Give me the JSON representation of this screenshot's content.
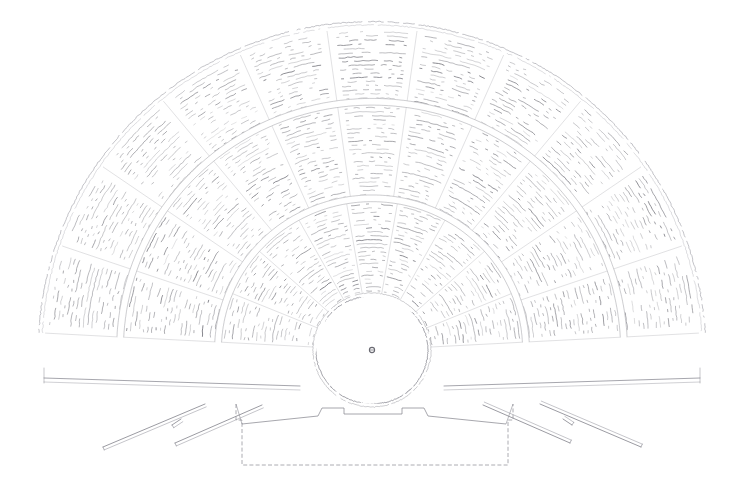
{
  "document": {
    "kind": "archaeological-plan",
    "subject": "Ancient Greek theatre ground plan",
    "medium": "faded ink line drawing on white paper",
    "background_color": "#ffffff",
    "width": 742,
    "height": 494
  },
  "palette": {
    "paper": "#ffffff",
    "seat_line": "#8d8d93",
    "seat_line_dark": "#6e6e76",
    "wall_line": "#7b7b84",
    "outer_arc": "#9a9aa2",
    "orchestra_line": "#7c7c86",
    "center_mark": "#5a5a63",
    "skene_line": "#84848d"
  },
  "geometry": {
    "center": {
      "x": 372,
      "y": 350
    },
    "orchestra": {
      "label": "orchestra",
      "radius_x": 56,
      "radius_y": 54,
      "center_x": 372,
      "center_y": 350
    },
    "center_mark": {
      "label": "omphalos-altar-mark",
      "x": 372,
      "y": 350,
      "radius": 2.6
    },
    "cavea": {
      "label": "cavea-seating-bowl",
      "inner_radius": 58,
      "outer_radius": 330,
      "start_angle_deg": 183,
      "end_angle_deg": 357,
      "squash_y": 0.985
    },
    "tiers": [
      {
        "name": "ima-cavea",
        "r_start": 60,
        "r_end": 150,
        "row_gap": 4.0,
        "wedges": 9
      },
      {
        "name": "media-cavea",
        "r_start": 158,
        "r_end": 248,
        "row_gap": 4.2,
        "wedges": 11
      },
      {
        "name": "summa-cavea",
        "r_start": 256,
        "r_end": 326,
        "row_gap": 4.2,
        "wedges": 11
      }
    ],
    "diazomata": [
      {
        "name": "lower-diazoma",
        "radius": 154
      },
      {
        "name": "upper-diazoma",
        "radius": 252
      }
    ],
    "analemma_left": {
      "x1": 44,
      "y1": 378,
      "x2": 300,
      "y2": 386
    },
    "analemma_right": {
      "x1": 700,
      "y1": 378,
      "x2": 444,
      "y2": 386
    },
    "parodos_walls": [
      {
        "name": "left-outer-parodos-wall",
        "x1": 103,
        "y1": 447,
        "x2": 205,
        "y2": 404
      },
      {
        "name": "left-inner-parodos-wall",
        "x1": 175,
        "y1": 443,
        "x2": 262,
        "y2": 405
      },
      {
        "name": "left-return-stub",
        "x1": 172,
        "y1": 425,
        "x2": 181,
        "y2": 419
      },
      {
        "name": "right-outer-parodos-wall",
        "x1": 641,
        "y1": 447,
        "x2": 540,
        "y2": 404
      },
      {
        "name": "right-inner-parodos-wall",
        "x1": 570,
        "y1": 443,
        "x2": 483,
        "y2": 405
      },
      {
        "name": "right-return-stub",
        "x1": 572,
        "y1": 425,
        "x2": 563,
        "y2": 419
      }
    ],
    "skene": {
      "name": "skene-stage-building",
      "outline": [
        [
          236,
          404
        ],
        [
          236,
          420
        ],
        [
          242,
          420
        ],
        [
          242,
          465
        ],
        [
          508,
          465
        ],
        [
          508,
          420
        ],
        [
          513,
          420
        ],
        [
          513,
          404
        ]
      ],
      "proskenion_front": [
        [
          242,
          424
        ],
        [
          318,
          416
        ],
        [
          322,
          408
        ],
        [
          344,
          408
        ],
        [
          344,
          414
        ],
        [
          402,
          414
        ],
        [
          402,
          408
        ],
        [
          424,
          408
        ],
        [
          428,
          416
        ],
        [
          506,
          424
        ]
      ]
    }
  },
  "legend": {
    "features": [
      {
        "key": "cavea",
        "label": "Cavea (auditorium)"
      },
      {
        "key": "orchestra",
        "label": "Orchestra"
      },
      {
        "key": "diazoma",
        "label": "Diazoma"
      },
      {
        "key": "kerkides",
        "label": "Kerkides (seat wedges)"
      },
      {
        "key": "parodos",
        "label": "Parodos"
      },
      {
        "key": "skene",
        "label": "Skene"
      },
      {
        "key": "analemma",
        "label": "Analemma (retaining wall)"
      }
    ]
  }
}
